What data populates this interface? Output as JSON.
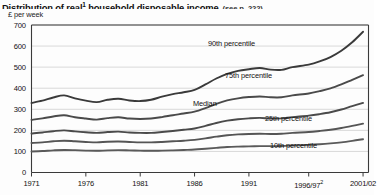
{
  "title": {
    "main": "Distribution of real",
    "main_sup": "1",
    "main_rest": " household disposable income",
    "note": "(see p. 222)"
  },
  "axis_unit": "£ per week",
  "chart_data": {
    "type": "line",
    "subtitle": "(see p. 222)",
    "xlabel": "",
    "ylabel": "£ per week",
    "ylim": [
      0,
      700
    ],
    "xlim": [
      1971,
      2002
    ],
    "grid": true,
    "legend_position": "inline-labels",
    "yticks": [
      0,
      100,
      200,
      300,
      400,
      500,
      600,
      700
    ],
    "xticks": [
      "1971",
      "1976",
      "1981",
      "1986",
      "1991",
      "1996/97",
      "2001/02"
    ],
    "xtick_values": [
      1971,
      1976,
      1981,
      1986,
      1991,
      1996.5,
      2001.5
    ],
    "x": [
      1971,
      1972,
      1973,
      1974,
      1975,
      1976,
      1977,
      1978,
      1979,
      1980,
      1981,
      1982,
      1983,
      1984,
      1985,
      1986,
      1987,
      1988,
      1989,
      1990,
      1991,
      1992,
      1993,
      1994,
      1995,
      1996.5,
      1997.5,
      1998.5,
      1999.5,
      2000.5,
      2001.5
    ],
    "series": [
      {
        "name": "90th percentile",
        "label": "90th percentile",
        "color": "#3a3a3a",
        "values": [
          330,
          341,
          356,
          366,
          352,
          341,
          334,
          345,
          350,
          342,
          339,
          345,
          360,
          372,
          381,
          392,
          418,
          446,
          468,
          482,
          490,
          496,
          488,
          487,
          500,
          512,
          527,
          548,
          578,
          618,
          668
        ]
      },
      {
        "name": "75th percentile",
        "label": "75th percentile",
        "color": "#4a4a4a",
        "values": [
          250,
          257,
          266,
          272,
          262,
          256,
          251,
          258,
          262,
          256,
          254,
          256,
          263,
          272,
          280,
          289,
          306,
          326,
          342,
          352,
          358,
          361,
          357,
          357,
          366,
          375,
          386,
          399,
          418,
          440,
          462
        ]
      },
      {
        "name": "Median",
        "label": "Median",
        "color": "#4a4a4a",
        "values": [
          185,
          190,
          196,
          200,
          195,
          191,
          188,
          192,
          194,
          190,
          188,
          188,
          192,
          197,
          203,
          209,
          221,
          235,
          246,
          253,
          257,
          259,
          256,
          257,
          263,
          270,
          277,
          286,
          299,
          315,
          330
        ]
      },
      {
        "name": "25th percentile",
        "label": "25th percentile",
        "color": "#555555",
        "values": [
          140,
          143,
          148,
          151,
          148,
          145,
          143,
          146,
          147,
          145,
          143,
          143,
          145,
          148,
          151,
          155,
          162,
          170,
          177,
          181,
          183,
          184,
          183,
          184,
          188,
          192,
          197,
          203,
          211,
          221,
          232
        ]
      },
      {
        "name": "10th percentile",
        "label": "10th percentile",
        "color": "#5a5a5a",
        "values": [
          100,
          102,
          105,
          107,
          106,
          104,
          103,
          105,
          106,
          105,
          104,
          103,
          104,
          105,
          107,
          109,
          113,
          117,
          121,
          123,
          124,
          125,
          125,
          126,
          128,
          131,
          134,
          138,
          143,
          150,
          158
        ]
      }
    ],
    "series_label_positions": [
      {
        "name": "90th percentile",
        "x": 208,
        "y": 39
      },
      {
        "name": "75th percentile",
        "x": 225,
        "y": 71
      },
      {
        "name": "Median",
        "x": 193,
        "y": 99
      },
      {
        "name": "25th percentile",
        "x": 265,
        "y": 114
      },
      {
        "name": "10th percentile",
        "x": 270,
        "y": 141
      }
    ]
  },
  "footnote_marks": {
    "x_1996_97": "2"
  }
}
